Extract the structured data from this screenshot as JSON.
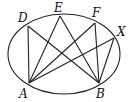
{
  "diagram": {
    "type": "geometry",
    "ellipse": {
      "cx": 64,
      "cy": 54,
      "rx": 56,
      "ry": 40
    },
    "points": [
      {
        "name": "A",
        "x": 29,
        "y": 83,
        "label_x": 19,
        "label_y": 98
      },
      {
        "name": "B",
        "x": 99,
        "y": 83,
        "label_x": 96,
        "label_y": 98
      },
      {
        "name": "D",
        "x": 28,
        "y": 26,
        "label_x": 18,
        "label_y": 22
      },
      {
        "name": "E",
        "x": 60,
        "y": 16,
        "label_x": 54,
        "label_y": 12
      },
      {
        "name": "F",
        "x": 95,
        "y": 23,
        "label_x": 92,
        "label_y": 17
      },
      {
        "name": "X",
        "x": 114,
        "y": 38,
        "label_x": 117,
        "label_y": 36
      }
    ],
    "segments": [
      [
        "A",
        "D"
      ],
      [
        "A",
        "E"
      ],
      [
        "A",
        "F"
      ],
      [
        "A",
        "X"
      ],
      [
        "B",
        "D"
      ],
      [
        "B",
        "E"
      ],
      [
        "B",
        "F"
      ],
      [
        "B",
        "X"
      ]
    ],
    "labels": {
      "A": "A",
      "B": "B",
      "D": "D",
      "E": "E",
      "F": "F",
      "X": "X"
    }
  }
}
